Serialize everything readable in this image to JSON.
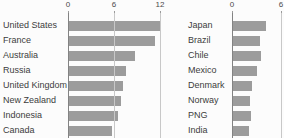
{
  "colors": {
    "background": "#fcfcfc",
    "bar": "#9c9c9c",
    "gridline": "#c8c8c8",
    "baseline": "#838383",
    "label_text": "#3d3d3d",
    "tick_text": "#4a4a4a"
  },
  "chart_data": [
    {
      "type": "bar",
      "orientation": "horizontal",
      "title": "",
      "xlabel": "",
      "ylabel": "",
      "categories": [
        "United States",
        "France",
        "Australia",
        "Russia",
        "United Kingdom",
        "New Zealand",
        "Indonesia",
        "Canada"
      ],
      "values": [
        12.1,
        11.3,
        8.7,
        7.5,
        7.2,
        6.9,
        6.5,
        5.7
      ],
      "xlim": [
        0,
        12
      ],
      "xticks": [
        0,
        6,
        12
      ],
      "grid": "vertical-at-ticks",
      "legend": "none"
    },
    {
      "type": "bar",
      "orientation": "horizontal",
      "title": "",
      "xlabel": "",
      "ylabel": "",
      "categories": [
        "Japan",
        "Brazil",
        "Chile",
        "Mexico",
        "Denmark",
        "Norway",
        "PNG",
        "India"
      ],
      "values": [
        4.2,
        3.4,
        3.5,
        3.0,
        2.4,
        2.2,
        2.3,
        2.1
      ],
      "xlim": [
        0,
        6
      ],
      "xticks": [
        0,
        6
      ],
      "grid": "vertical-at-ticks",
      "legend": "none"
    }
  ]
}
